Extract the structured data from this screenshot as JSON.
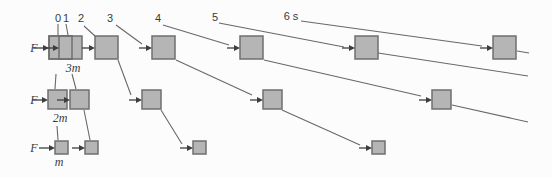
{
  "figure": {
    "description_labels": {
      "time_unit_suffix": "s"
    },
    "colors": {
      "background": "#fcfcfc",
      "block_fill": "#b5b5b5",
      "block_stroke": "#6f6f6f",
      "leader_line": "#686868",
      "arrow": "#3e3e3e",
      "text": "#3a3a3a"
    },
    "time_labels": [
      {
        "text": "0",
        "x": 58,
        "y": 22
      },
      {
        "text": "1",
        "x": 66,
        "y": 22
      },
      {
        "text": "2",
        "x": 81,
        "y": 22
      },
      {
        "text": "3",
        "x": 110,
        "y": 22
      },
      {
        "text": "4",
        "x": 158,
        "y": 22
      },
      {
        "text": "5",
        "x": 215,
        "y": 21
      },
      {
        "text": "6 s",
        "x": 291,
        "y": 20
      }
    ],
    "rows": [
      {
        "name": "row-3m",
        "force_label": "F",
        "force_label_x": 34,
        "force_label_y": 52,
        "mass_label": "3m",
        "mass_label_x": 73,
        "mass_label_y": 72,
        "block_y": 36,
        "block_size": 23,
        "blocks": [
          {
            "t": 0,
            "x": 49,
            "restroke": true
          },
          {
            "t": 1,
            "x": 59
          },
          {
            "t": 2,
            "x": 95
          },
          {
            "t": 3,
            "x": 152
          },
          {
            "t": 4,
            "x": 240
          },
          {
            "t": 5,
            "x": 355
          },
          {
            "t": 6,
            "x": 493
          }
        ]
      },
      {
        "name": "row-2m",
        "force_label": "F",
        "force_label_x": 34,
        "force_label_y": 104,
        "mass_label": "2m",
        "mass_label_x": 60,
        "mass_label_y": 122,
        "block_y": 90,
        "block_size": 19,
        "blocks": [
          {
            "t": 0,
            "x": 48
          },
          {
            "t": 1,
            "x": 70
          },
          {
            "t": 2,
            "x": 142
          },
          {
            "t": 3,
            "x": 263
          },
          {
            "t": 4,
            "x": 432
          }
        ]
      },
      {
        "name": "row-m",
        "force_label": "F",
        "force_label_x": 34,
        "force_label_y": 152,
        "mass_label": "m",
        "mass_label_x": 59,
        "mass_label_y": 166,
        "block_y": 141,
        "block_size": 13,
        "blocks": [
          {
            "t": 0,
            "x": 55
          },
          {
            "t": 1,
            "x": 85
          },
          {
            "t": 2,
            "x": 193
          },
          {
            "t": 3,
            "x": 372
          }
        ]
      }
    ],
    "force_arrows": [
      {
        "row": "row-3m",
        "t": 0,
        "tip_x": 49,
        "y": 48,
        "tail": 11
      },
      {
        "row": "row-3m",
        "t": 1,
        "tip_x": 59,
        "y": 48,
        "tail": 8
      },
      {
        "row": "row-3m",
        "t": 2,
        "tip_x": 95,
        "y": 48,
        "tail": 8
      },
      {
        "row": "row-3m",
        "t": 3,
        "tip_x": 152,
        "y": 48,
        "tail": 8
      },
      {
        "row": "row-3m",
        "t": 4,
        "tip_x": 240,
        "y": 48,
        "tail": 8
      },
      {
        "row": "row-3m",
        "t": 5,
        "tip_x": 355,
        "y": 48,
        "tail": 8
      },
      {
        "row": "row-3m",
        "t": 6,
        "tip_x": 493,
        "y": 48,
        "tail": 8
      },
      {
        "row": "row-2m",
        "t": 0,
        "tip_x": 48,
        "y": 100,
        "tail": 11
      },
      {
        "row": "row-2m",
        "t": 1,
        "tip_x": 70,
        "y": 100,
        "tail": 8
      },
      {
        "row": "row-2m",
        "t": 2,
        "tip_x": 142,
        "y": 100,
        "tail": 8
      },
      {
        "row": "row-2m",
        "t": 3,
        "tip_x": 263,
        "y": 100,
        "tail": 8
      },
      {
        "row": "row-2m",
        "t": 4,
        "tip_x": 432,
        "y": 100,
        "tail": 8
      },
      {
        "row": "row-m",
        "t": 0,
        "tip_x": 55,
        "y": 148,
        "tail": 11
      },
      {
        "row": "row-m",
        "t": 1,
        "tip_x": 85,
        "y": 148,
        "tail": 8
      },
      {
        "row": "row-m",
        "t": 2,
        "tip_x": 193,
        "y": 148,
        "tail": 8
      },
      {
        "row": "row-m",
        "t": 3,
        "tip_x": 372,
        "y": 148,
        "tail": 8
      }
    ],
    "leader_lines": [
      {
        "name": "t0-label-to-3m",
        "x1": 58,
        "y1": 24,
        "x2": 58,
        "y2": 35
      },
      {
        "name": "t0-3m-to-2m",
        "x1": 56,
        "y1": 74,
        "x2": 55,
        "y2": 89
      },
      {
        "name": "t0-2m-to-m",
        "x1": 57,
        "y1": 126,
        "x2": 58,
        "y2": 140
      },
      {
        "name": "t1-label-to-3m",
        "x1": 66,
        "y1": 24,
        "x2": 68,
        "y2": 35
      },
      {
        "name": "t1-3m-to-2m",
        "x1": 72,
        "y1": 74,
        "x2": 76,
        "y2": 89
      },
      {
        "name": "t1-2m-to-m",
        "x1": 84,
        "y1": 110,
        "x2": 90,
        "y2": 140
      },
      {
        "name": "t2-label-to-3m",
        "x1": 84,
        "y1": 26,
        "x2": 95,
        "y2": 36
      },
      {
        "name": "t2-3m-to-2m",
        "x1": 118,
        "y1": 60,
        "x2": 131,
        "y2": 95
      },
      {
        "name": "t2-2m-to-m",
        "x1": 161,
        "y1": 110,
        "x2": 182,
        "y2": 144
      },
      {
        "name": "t3-label-to-3m",
        "x1": 116,
        "y1": 25,
        "x2": 142,
        "y2": 44
      },
      {
        "name": "t3-3m-to-2m",
        "x1": 176,
        "y1": 60,
        "x2": 252,
        "y2": 95
      },
      {
        "name": "t3-2m-to-m",
        "x1": 282,
        "y1": 110,
        "x2": 360,
        "y2": 145
      },
      {
        "name": "t4-label-to-3m",
        "x1": 163,
        "y1": 25,
        "x2": 229,
        "y2": 45
      },
      {
        "name": "t4-3m-to-2m",
        "x1": 264,
        "y1": 60,
        "x2": 421,
        "y2": 96
      },
      {
        "name": "t4-2m-offframe",
        "x1": 452,
        "y1": 105,
        "x2": 528,
        "y2": 122
      },
      {
        "name": "t5-label-to-3m",
        "x1": 219,
        "y1": 23,
        "x2": 344,
        "y2": 47
      },
      {
        "name": "t5-3m-offframe",
        "x1": 378,
        "y1": 53,
        "x2": 528,
        "y2": 76
      },
      {
        "name": "t6-label-to-3m",
        "x1": 301,
        "y1": 21,
        "x2": 482,
        "y2": 46
      },
      {
        "name": "t6-3m-offframe",
        "x1": 517,
        "y1": 51,
        "x2": 529,
        "y2": 53
      }
    ]
  }
}
